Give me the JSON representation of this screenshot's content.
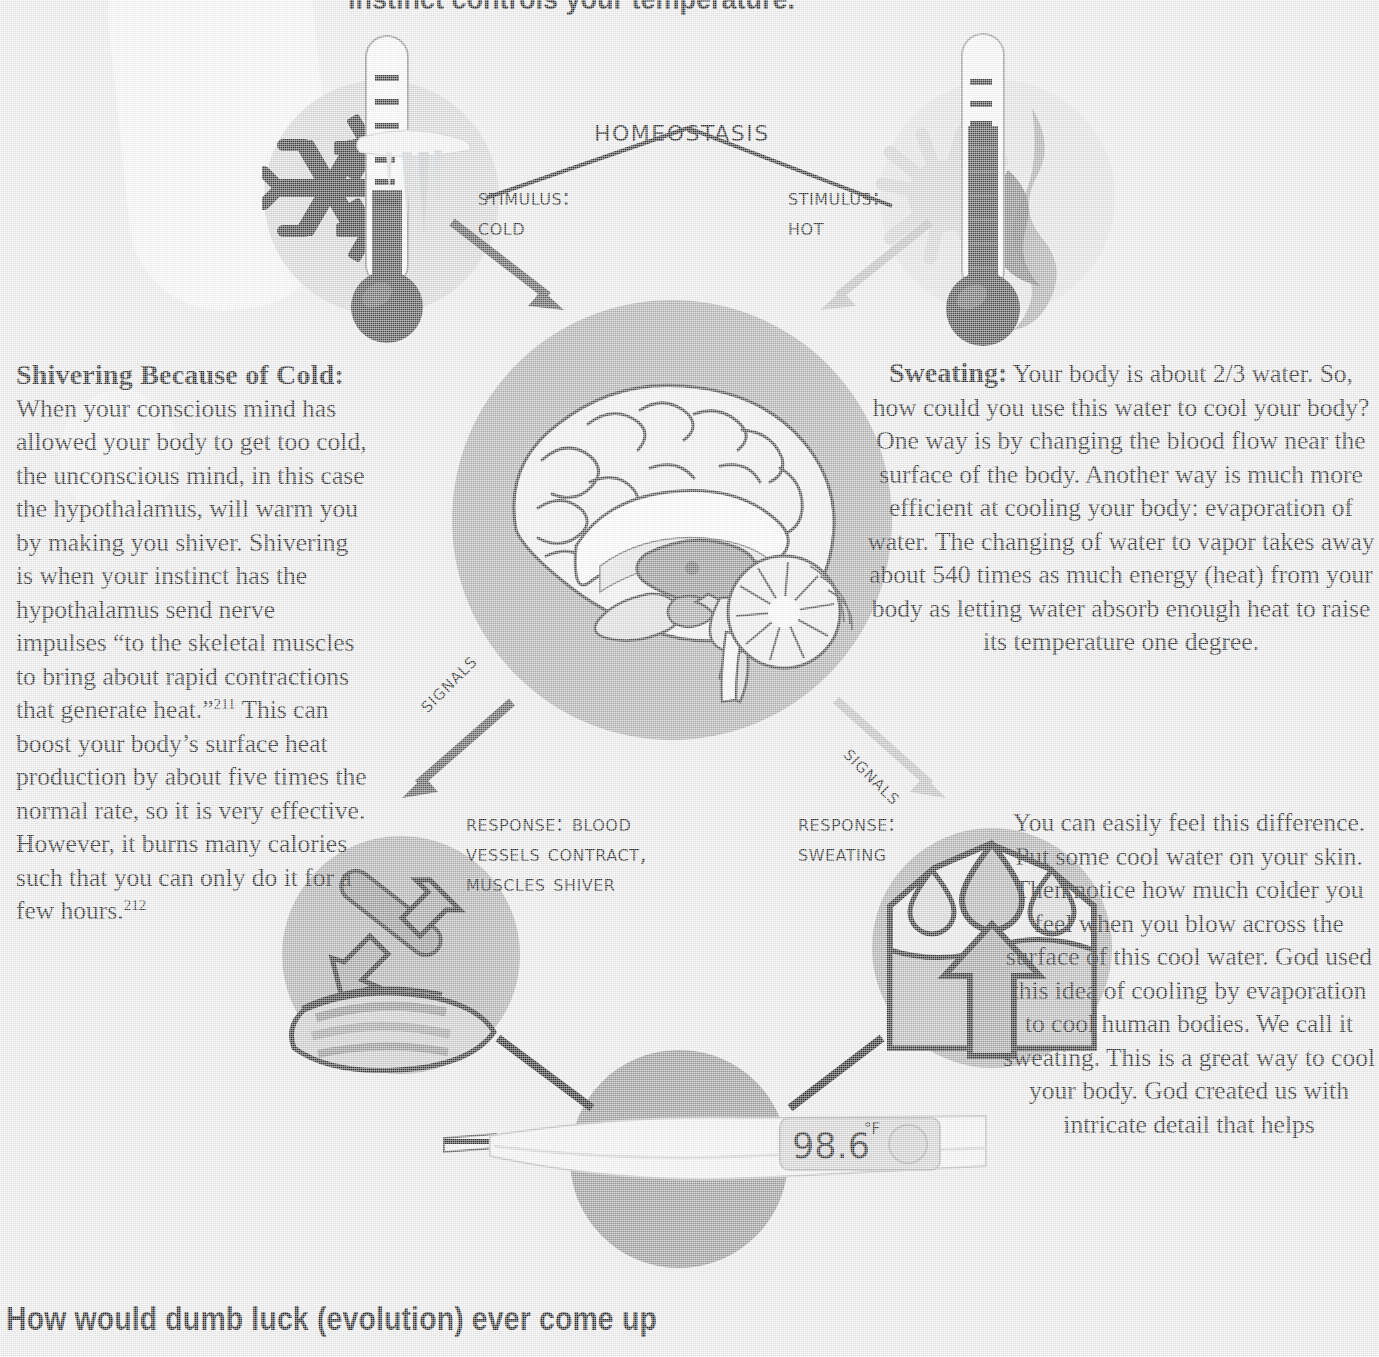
{
  "page": {
    "heading": "instinct controls your temperature.",
    "banner": "How would dumb luck (evolution) ever come up"
  },
  "diagram": {
    "title_label": "Homeostasis",
    "stimulus_cold": "Stimulus:\n  Cold",
    "stimulus_hot": "Stimulus:\n  Hot",
    "signals_left": "Signals",
    "signals_right": "Signals",
    "response_cold": "Response: Blood\nVessels Contract,\nMuscles Shiver",
    "response_hot": "Response:\nSweating",
    "thermometer_reading": "98.6",
    "thermometer_unit": "°F"
  },
  "left_column": {
    "heading": "Shivering Because of Cold:",
    "paragraph_part1": "When your conscious mind has allowed your body to get too cold, the unconscious mind, in this case the hypothalamus, will warm you by making you shiver. Shivering is when your instinct has the hypothalamus send nerve impulses “to the skeletal muscles to bring about rapid contractions that generate heat.”",
    "footnote1": "211",
    "paragraph_part2": "This can boost your body’s surface heat production by about five times the normal rate, so it is very effective. However, it burns many calories such that you can only do it for a few hours.",
    "footnote2": "212"
  },
  "right_column": {
    "heading": "Sweating:",
    "paragraph1": " Your body is about 2/3 water. So, how could you use this water to cool your body? One way is by changing the blood flow near the surface of the body. Another way is much more efficient at cooling your body: evaporation of water. The changing of water to vapor takes away about 540 times as much energy (heat) from your body as letting water absorb enough heat to raise its temperature one degree.",
    "paragraph2": "You can easily feel this difference. Put some cool water on your skin. Then notice how much colder you feel when you blow across the surface of this cool water. God used this idea of cooling by evaporation to cool human bodies. We call it sweating. This is a great way to cool your body. God created us with intricate detail that helps"
  },
  "colors": {
    "background": "#eeeeee",
    "circle_brain": "#a9a9a9",
    "circle_cold": "#d7d7d7",
    "circle_hot": "#e4e4e4",
    "circle_response": "#a9a9a9",
    "circle_thermometer": "#8f8f8f",
    "arrow_dark": "#4a4a4a",
    "arrow_light": "#bdbdbd",
    "text": "#151515"
  },
  "icons": {
    "snowflake": "snowflake-icon",
    "sun": "sun-icon",
    "flame": "flame-icon",
    "thermometer_cold": "thermometer-cold-icon",
    "thermometer_hot": "thermometer-hot-icon",
    "brain": "brain-icon",
    "vessel_contract": "vessel-contract-icon",
    "sweat_drops": "sweat-evaporation-icon",
    "digital_thermometer": "digital-thermometer-icon"
  }
}
